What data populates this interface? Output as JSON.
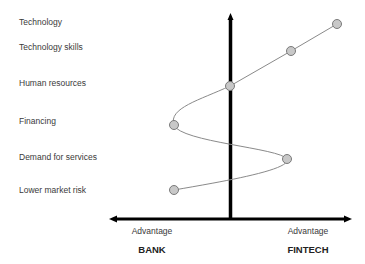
{
  "diagram": {
    "factors": [
      {
        "label": "Technology",
        "x": 337,
        "y": 24,
        "label_y": 17
      },
      {
        "label": "Technology skills",
        "x": 291,
        "y": 51,
        "label_y": 42
      },
      {
        "label": "Human resources",
        "x": 230,
        "y": 86,
        "label_y": 78
      },
      {
        "label": "Financing",
        "x": 174,
        "y": 125,
        "label_y": 116
      },
      {
        "label": "Demand for services",
        "x": 287,
        "y": 159,
        "label_y": 152
      },
      {
        "label": "Lower market risk",
        "x": 174,
        "y": 190,
        "label_y": 185
      }
    ],
    "axis": {
      "left_advantage": "Advantage",
      "left_side": "BANK",
      "right_advantage": "Advantage",
      "right_side": "FINTECH"
    },
    "colors": {
      "axis": "#000000",
      "curve": "#8a8a8a",
      "marker_fill": "#c8c8c8",
      "marker_stroke": "#7a7a7a"
    }
  }
}
